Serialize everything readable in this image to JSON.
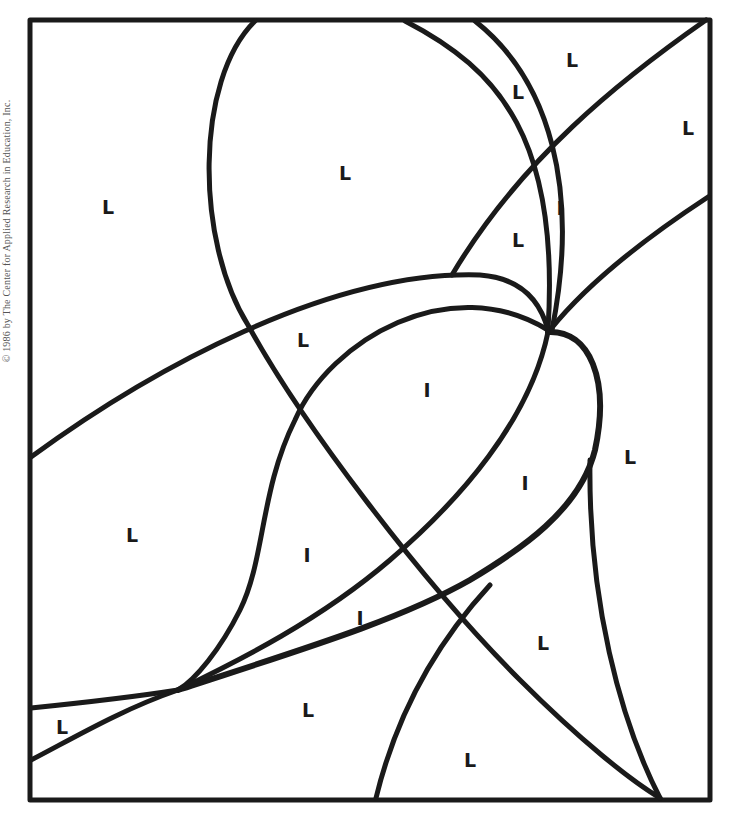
{
  "worksheet": {
    "copyright": "© 1986 by The Center for Applied Research in Education, Inc.",
    "line_color": "#1a1a1a",
    "regions": [
      {
        "letter": "L",
        "x": 108,
        "y": 207
      },
      {
        "letter": "L",
        "x": 345,
        "y": 173
      },
      {
        "letter": "L",
        "x": 518,
        "y": 92
      },
      {
        "letter": "L",
        "x": 572,
        "y": 60
      },
      {
        "letter": "L",
        "x": 688,
        "y": 128
      },
      {
        "letter": "I",
        "x": 560,
        "y": 208
      },
      {
        "letter": "L",
        "x": 518,
        "y": 240
      },
      {
        "letter": "L",
        "x": 303,
        "y": 340
      },
      {
        "letter": "I",
        "x": 427,
        "y": 390
      },
      {
        "letter": "I",
        "x": 525,
        "y": 483
      },
      {
        "letter": "L",
        "x": 630,
        "y": 457
      },
      {
        "letter": "L",
        "x": 132,
        "y": 535
      },
      {
        "letter": "I",
        "x": 307,
        "y": 555
      },
      {
        "letter": "I",
        "x": 360,
        "y": 618
      },
      {
        "letter": "L",
        "x": 543,
        "y": 643
      },
      {
        "letter": "L",
        "x": 308,
        "y": 710
      },
      {
        "letter": "L",
        "x": 62,
        "y": 727
      },
      {
        "letter": "L",
        "x": 470,
        "y": 760
      }
    ]
  }
}
